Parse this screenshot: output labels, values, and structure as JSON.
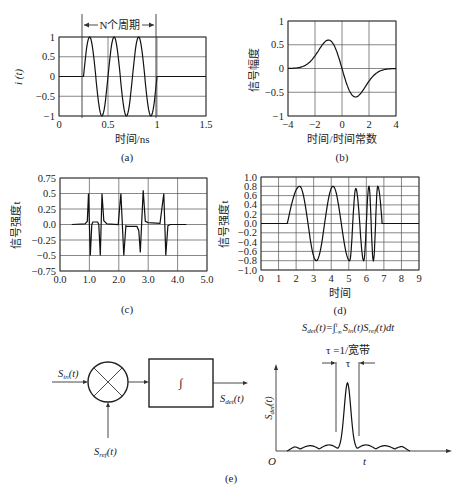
{
  "chart_data": [
    {
      "id": "a",
      "type": "line",
      "caption": "(a)",
      "xlabel": "时间/ns",
      "ylabel": "i (t)",
      "annotation": "N个周期",
      "xlim": [
        0,
        1.5
      ],
      "ylim": [
        -1,
        1
      ],
      "xticks": [
        "0",
        "0.5",
        "1",
        "1.5"
      ],
      "yticks": [
        "1",
        "0.5",
        "0",
        "−0.5",
        "−1"
      ],
      "grid": true,
      "series": [
        {
          "name": "i(t)",
          "description": "zero until t=0.25ns, then 3 sine cycles (period 0.25ns) ending at t=1ns, amplitude 1"
        }
      ],
      "x": [
        0,
        0.25,
        0.3125,
        0.375,
        0.4375,
        0.5,
        0.5625,
        0.625,
        0.6875,
        0.75,
        0.8125,
        0.875,
        0.9375,
        1.0
      ],
      "values": [
        0,
        0,
        1,
        0,
        -1,
        0,
        1,
        0,
        -1,
        0,
        1,
        0,
        -1,
        0
      ]
    },
    {
      "id": "b",
      "type": "line",
      "caption": "(b)",
      "xlabel": "时间/时间常数",
      "ylabel": "信号幅度",
      "xlim": [
        -4,
        4
      ],
      "ylim": [
        -1,
        1
      ],
      "xticks": [
        "−4",
        "−2",
        "0",
        "2",
        "4"
      ],
      "yticks": [
        "1",
        "0.5",
        "0",
        "−0.5",
        "−1"
      ],
      "grid": true,
      "series": [
        {
          "name": "Gaussian derivative (monocycle)"
        }
      ],
      "x": [
        -4,
        -3,
        -2,
        -1,
        0,
        1,
        2,
        3,
        4
      ],
      "values": [
        0.0,
        0.05,
        0.35,
        0.6,
        0.0,
        -0.6,
        -0.35,
        -0.05,
        0.0
      ]
    },
    {
      "id": "c",
      "type": "line",
      "caption": "(c)",
      "xlabel": "",
      "ylabel": "信号强度t",
      "xlim": [
        0,
        5
      ],
      "ylim": [
        -0.75,
        0.75
      ],
      "xticks": [
        "0.0",
        "1.0",
        "2.0",
        "3.0",
        "4.0",
        "5.0"
      ],
      "yticks": [
        "0.75",
        "0.5",
        "0.25",
        "0.0",
        "−0.25",
        "−0.5",
        "−0.75"
      ],
      "grid": true,
      "series": [
        {
          "name": "pulse train",
          "description": "sharp spikes of ±0.5 amplitude"
        }
      ],
      "spikes": [
        {
          "x": 0.97,
          "y": 0.5
        },
        {
          "x": 1.03,
          "y": -0.5
        },
        {
          "x": 1.37,
          "y": -0.5
        },
        {
          "x": 1.43,
          "y": 0.5
        },
        {
          "x": 2.07,
          "y": 0.5
        },
        {
          "x": 2.17,
          "y": -0.5
        },
        {
          "x": 2.73,
          "y": -0.45
        },
        {
          "x": 2.83,
          "y": 0.55
        },
        {
          "x": 3.53,
          "y": 0.5
        },
        {
          "x": 3.6,
          "y": -0.5
        }
      ]
    },
    {
      "id": "d",
      "type": "line",
      "caption": "(d)",
      "xlabel": "时间",
      "ylabel": "信号强度t",
      "xlim": [
        0,
        9
      ],
      "ylim": [
        -1.0,
        1.0
      ],
      "xticks": [
        "0",
        "1",
        "2",
        "3",
        "4",
        "5",
        "6",
        "7",
        "8",
        "9"
      ],
      "yticks": [
        "1.0",
        "0.8",
        "0.6",
        "0.4",
        "0.2",
        "0.0",
        "−0.2",
        "−0.4",
        "−0.6",
        "−0.8",
        "−1.0"
      ],
      "grid": true,
      "series": [
        {
          "name": "chirp",
          "description": "increasing frequency oscillation, amplitude 0.8, from t≈1.5 to t≈6.9"
        }
      ],
      "peaks": [
        {
          "x": 2.2,
          "y": 0.8
        },
        {
          "x": 3.15,
          "y": -0.8
        },
        {
          "x": 4.1,
          "y": 0.8
        },
        {
          "x": 5.05,
          "y": -0.8
        },
        {
          "x": 5.4,
          "y": 0.75
        },
        {
          "x": 5.85,
          "y": -0.8
        },
        {
          "x": 6.15,
          "y": 0.8
        },
        {
          "x": 6.4,
          "y": -0.8
        },
        {
          "x": 6.65,
          "y": 0.8
        }
      ]
    },
    {
      "id": "e",
      "type": "line",
      "caption": "(e)",
      "formula": "S_det(t)=∫_{−∞}^{t} S_in(t)S_ref(t)dt",
      "xlabel": "t",
      "ylabel": "S_det(t)",
      "origin_label": "O",
      "annotation": "τ =1/宽带",
      "tau_label": "τ",
      "description": "correlator output: central peak with small ripples on both sides"
    }
  ],
  "diagram": {
    "input_label_main": "S",
    "input_label_sub": "in",
    "ref_label_main": "S",
    "ref_label_sub": "ref",
    "output_label_main": "S",
    "output_label_sub": "det",
    "arg": "(t)",
    "mixer_symbol": "⊗",
    "integrator_symbol": "∫"
  },
  "formula": {
    "lhs_main": "S",
    "lhs_sub": "det",
    "lhs_arg": "(t)=",
    "integral": "∫",
    "upper": "t",
    "lower": "−∞",
    "t1_main": "S",
    "t1_sub": "in",
    "t1_arg": "(t)",
    "t2_main": "S",
    "t2_sub": "ref",
    "t2_arg": "(t)dt"
  }
}
